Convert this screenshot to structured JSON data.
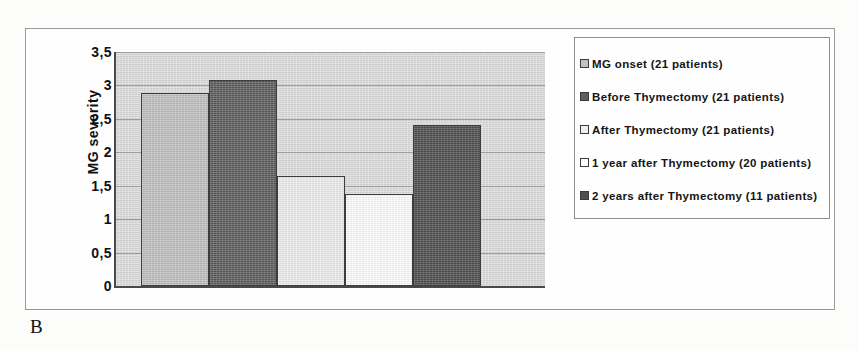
{
  "panel": {
    "letter": "B"
  },
  "chart_data": {
    "type": "bar",
    "title": "",
    "xlabel": "",
    "ylabel": "MG severity",
    "ylim": [
      0,
      3.5
    ],
    "ytick_labels": [
      "3,5",
      "3",
      "2,5",
      "2",
      "1,5",
      "1",
      "0,5",
      "0"
    ],
    "ytick_values": [
      3.5,
      3,
      2.5,
      2,
      1.5,
      1,
      0.5,
      0
    ],
    "grid": true,
    "legend_position": "right",
    "categories": [
      "MG onset (21 patients)",
      "Before Thymectomy (21 patients)",
      "After Thymectomy (21 patients)",
      "1 year after Thymectomy (20 patients)",
      "2 years after Thymectomy (11 patients)"
    ],
    "values": [
      2.89,
      3.08,
      1.65,
      1.38,
      2.41
    ],
    "bar_colors": [
      "#c2c2c2",
      "#5e5e5e",
      "#efefef",
      "#ffffff",
      "#4f4f4f"
    ],
    "plot_background": "#d8d8d8",
    "axis_color": "#4a4a4a",
    "gridline_color": "#9d9d9d"
  },
  "legend": {
    "items": [
      {
        "label": "MG onset (21 patients)",
        "color": "#c2c2c2"
      },
      {
        "label": "Before Thymectomy (21 patients)",
        "color": "#5e5e5e"
      },
      {
        "label": "After Thymectomy (21 patients)",
        "color": "#efefef"
      },
      {
        "label": "1 year after Thymectomy (20 patients)",
        "color": "#ffffff"
      },
      {
        "label": "2 years after Thymectomy (11 patients)",
        "color": "#4f4f4f"
      }
    ]
  }
}
